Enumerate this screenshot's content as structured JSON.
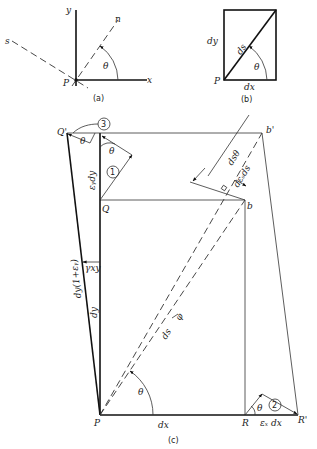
{
  "figure": {
    "part_a": {
      "caption": "(a)",
      "labels": {
        "y": "y",
        "x": "x",
        "n": "n",
        "s": "s",
        "P": "P",
        "theta": "θ"
      }
    },
    "part_b": {
      "caption": "(b)",
      "labels": {
        "dy": "dy",
        "dx": "dx",
        "ds": "ds",
        "P": "P",
        "theta": "θ"
      }
    },
    "part_c": {
      "caption": "(c)",
      "labels": {
        "Q_prime": "Q'",
        "b_prime": "b'",
        "Q": "Q",
        "b": "b",
        "P": "P",
        "R": "R",
        "R_prime": "R'",
        "circle1": "1",
        "circle2": "2",
        "circle3": "3",
        "theta_top_left": "θ",
        "theta_top": "θ",
        "theta_bottom": "θ",
        "theta_right": "θ",
        "eps_y_dy": "εᵧdy",
        "eps_x_dx": "εₓ dx",
        "gamma_xy": "γxy",
        "dy_one_plus_eps": "dy(1+εᵧ)",
        "dy": "dy",
        "dx": "dx",
        "ds": "ds",
        "d_theta": "dsθ",
        "ds_eps": "dεₛds",
        "phi": "φ"
      }
    }
  }
}
